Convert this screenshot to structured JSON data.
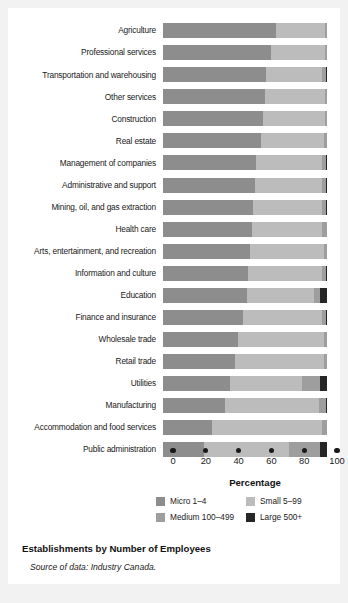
{
  "chart_data": {
    "type": "bar",
    "subtype": "horizontal stacked 100%",
    "title": "Establishments by Number of Employees",
    "source_note": "Source of data: Industry Canada.",
    "xlabel": "Percentage",
    "ylabel": "",
    "xlim": [
      0,
      100
    ],
    "xticks": [
      0,
      20,
      40,
      60,
      80,
      100
    ],
    "grid": false,
    "legend_position": "bottom",
    "categories": [
      "Agriculture",
      "Professional services",
      "Transportation and warehousing",
      "Other services",
      "Construction",
      "Real estate",
      "Management of companies",
      "Administrative and support",
      "Mining, oil, and gas extraction",
      "Health care",
      "Arts, entertainment, and recreation",
      "Information and culture",
      "Education",
      "Finance and insurance",
      "Wholesale trade",
      "Retail trade",
      "Utilities",
      "Manufacturing",
      "Accommodation and food services",
      "Public administration"
    ],
    "series": [
      {
        "name": "Micro 1–4",
        "color": "#8d8d8d",
        "values": [
          69,
          66,
          63,
          62,
          61,
          60,
          57,
          56,
          55,
          54,
          53,
          52,
          51,
          49,
          46,
          44,
          41,
          38,
          30,
          25
        ]
      },
      {
        "name": "Small 5–99",
        "color": "#bcbcbc",
        "values": [
          30,
          33,
          34,
          37,
          38,
          38,
          40,
          41,
          42,
          43,
          45,
          45,
          41,
          48,
          52,
          54,
          44,
          57,
          67,
          52
        ]
      },
      {
        "name": "Medium 100–499",
        "color": "#9e9e9e",
        "values": [
          1,
          1,
          2.6,
          1,
          1,
          1.8,
          2.6,
          2.6,
          2.6,
          2.8,
          1.8,
          2.6,
          4,
          2.6,
          1.8,
          1.8,
          11,
          4.6,
          2.8,
          19
        ]
      },
      {
        "name": "Large 500+",
        "color": "#262626",
        "values": [
          0,
          0,
          0.4,
          0,
          0,
          0.2,
          0.4,
          0.4,
          0.4,
          0.2,
          0.2,
          0.4,
          4,
          0.4,
          0.2,
          0.2,
          4,
          0.4,
          0.2,
          4
        ]
      }
    ]
  },
  "legend": {
    "items": [
      {
        "label": "Micro 1–4",
        "color": "#8d8d8d"
      },
      {
        "label": "Small 5–99",
        "color": "#bcbcbc"
      },
      {
        "label": "Medium 100–499",
        "color": "#9e9e9e"
      },
      {
        "label": "Large 500+",
        "color": "#262626"
      }
    ]
  },
  "axis": {
    "title": "Percentage",
    "ticks": [
      "0",
      "20",
      "40",
      "60",
      "80",
      "100"
    ]
  },
  "caption": {
    "title": "Establishments by Number of Employees",
    "source": "Source of data: Industry Canada."
  },
  "colors": {
    "background": "#f2f2f2",
    "panel": "#ffffff",
    "text": "#1a1a1a",
    "micro": "#8d8d8d",
    "small": "#bcbcbc",
    "medium": "#9e9e9e",
    "large": "#262626"
  }
}
